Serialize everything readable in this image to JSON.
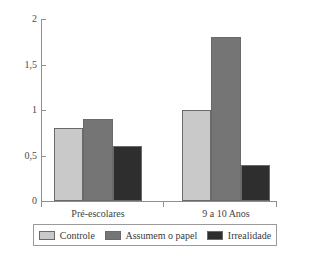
{
  "chart_data": {
    "type": "bar",
    "title": "",
    "subtitle": "",
    "xlabel": "",
    "ylabel": "",
    "categories": [
      "Pré-escolares",
      "9 a 10 Anos"
    ],
    "series": [
      {
        "name": "Controle",
        "values": [
          0.8,
          1.0
        ],
        "color": "#c9c9c9"
      },
      {
        "name": "Assumem o papel",
        "values": [
          0.9,
          1.8
        ],
        "color": "#757575"
      },
      {
        "name": "Irrealidade",
        "values": [
          0.6,
          0.4
        ],
        "color": "#2e2e2e"
      }
    ],
    "ylim": [
      0,
      2
    ],
    "ytick_values": [
      0,
      0.5,
      1,
      1.5,
      2
    ],
    "ytick_labels": [
      "0",
      "0,5",
      "1",
      "1,5",
      "2"
    ],
    "grid": false,
    "legend_position": "bottom",
    "decimal_separator": ",",
    "axis_color": "#8e8e8e",
    "bar_border_color": "#6a6a6a",
    "background": "#ffffff"
  }
}
